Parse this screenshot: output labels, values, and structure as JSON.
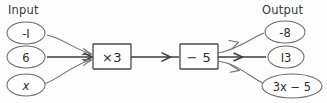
{
  "diagram": {
    "type": "function-machine",
    "title_left": "Input",
    "title_right": "Output",
    "inputs": [
      {
        "label": "-I",
        "value": "-1"
      },
      {
        "label": "6",
        "value": "6"
      },
      {
        "label": "x",
        "value": "x"
      }
    ],
    "operations": [
      {
        "label": "×3",
        "op": "multiply",
        "operand": "3"
      },
      {
        "label": "− 5",
        "op": "subtract",
        "operand": "5"
      }
    ],
    "outputs": [
      {
        "label": "-8",
        "value": "-8"
      },
      {
        "label": "I3",
        "value": "13"
      },
      {
        "label": "3x − 5",
        "value": "3x - 5"
      }
    ],
    "colors": {
      "background": "#fdfdfd",
      "node_stroke": "#6b6b6b",
      "box_stroke": "#4a4a4a",
      "connector": "#6e6e6e",
      "connector_main": "#3d3d3d",
      "text": "#2e2e2e",
      "header_text": "#3a3a3a"
    }
  }
}
